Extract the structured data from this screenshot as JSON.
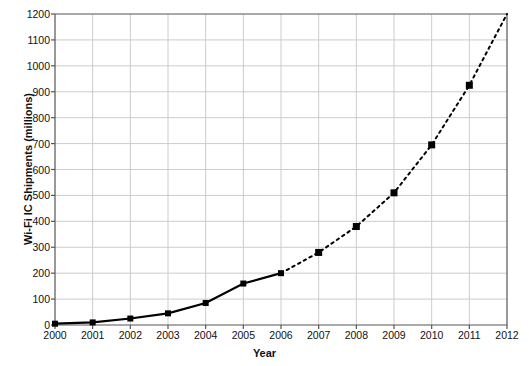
{
  "chart_data": {
    "type": "line",
    "title": "",
    "xlabel": "Year",
    "ylabel": "Wi-Fi IC Shipments (millions)",
    "x": [
      2000,
      2001,
      2002,
      2003,
      2004,
      2005,
      2006,
      2007,
      2008,
      2009,
      2010,
      2011,
      2012
    ],
    "categories": [
      "2000",
      "2001",
      "2002",
      "2003",
      "2004",
      "2005",
      "2006",
      "2007",
      "2008",
      "2009",
      "2010",
      "2011",
      "2012"
    ],
    "values": [
      5,
      10,
      25,
      45,
      85,
      160,
      200,
      280,
      380,
      510,
      695,
      925,
      1200
    ],
    "series": [
      {
        "name": "Wi-Fi IC Shipments (millions)",
        "values": [
          5,
          10,
          25,
          45,
          85,
          160,
          200,
          280,
          380,
          510,
          695,
          925,
          1200
        ],
        "segments": [
          {
            "style": "solid",
            "note": "historical",
            "x_from": 2000,
            "x_to": 2006
          },
          {
            "style": "dashed",
            "note": "forecast",
            "x_from": 2006,
            "x_to": 2012
          }
        ],
        "marker": "square",
        "color": "#000000"
      }
    ],
    "xlim": [
      2000,
      2012
    ],
    "ylim": [
      0,
      1200
    ],
    "ytick_labels": [
      "0",
      "100",
      "200",
      "300",
      "400",
      "500",
      "600",
      "700",
      "800",
      "900",
      "1000",
      "1100",
      "1200"
    ],
    "ytick_values": [
      0,
      100,
      200,
      300,
      400,
      500,
      600,
      700,
      800,
      900,
      1000,
      1100,
      1200
    ],
    "xtick_labels": [
      "2000",
      "2001",
      "2002",
      "2003",
      "2004",
      "2005",
      "2006",
      "2007",
      "2008",
      "2009",
      "2010",
      "2011",
      "2012"
    ],
    "grid": true,
    "grid_color": "#cccccc",
    "legend": "none",
    "axis_color": "#555555",
    "line_color": "#000000",
    "background": "#ffffff"
  }
}
